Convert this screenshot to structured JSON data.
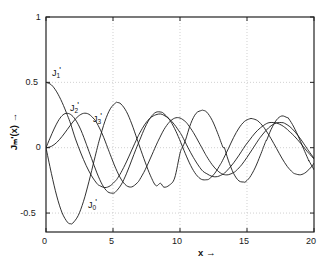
{
  "figure": {
    "background_color": "#ffffff",
    "curve_color": "#1a1a1a",
    "axis_color": "#222222",
    "grid_color": "#bbbbbb"
  },
  "axes": {
    "x_title": "x  →",
    "y_title": "Jₘ'(x)  →",
    "y_title_plain": "Jm'(x)",
    "x_ticks": [
      "0",
      "5",
      "10",
      "15",
      "20"
    ],
    "x_tick_values": [
      0,
      5,
      10,
      15,
      20
    ],
    "y_ticks": [
      "1",
      "0.5",
      "0",
      "-0.5"
    ],
    "y_tick_values": [
      1,
      0.5,
      0,
      -0.5
    ]
  },
  "curve_labels": [
    {
      "name": "J0-prime-label",
      "base": "J",
      "sub": "0",
      "prime": "'",
      "x_px": 88,
      "y_px": 198
    },
    {
      "name": "J1-prime-label",
      "base": "J",
      "sub": "1",
      "prime": "'",
      "x_px": 52,
      "y_px": 66
    },
    {
      "name": "J2-prime-label",
      "base": "J",
      "sub": "2",
      "prime": "'",
      "x_px": 70,
      "y_px": 101
    },
    {
      "name": "J3-prime-label",
      "base": "J",
      "sub": "3",
      "prime": "'",
      "x_px": 93,
      "y_px": 112
    }
  ],
  "chart_data": {
    "type": "line",
    "title": "",
    "subtitle": "",
    "xlabel": "x →",
    "ylabel": "J_m'(x) →",
    "xlim": [
      0,
      20
    ],
    "ylim": [
      -0.645,
      1.0
    ],
    "grid": true,
    "grid_style": "dotted",
    "legend": "inline-curve-labels",
    "legend_position": "inline",
    "x_tick_labels": [
      "0",
      "5",
      "10",
      "15",
      "20"
    ],
    "y_tick_labels": [
      "1",
      "0.5",
      "0",
      "-0.5"
    ],
    "annotations": [
      {
        "text": "J0'",
        "x": 1.3,
        "y": -0.38
      },
      {
        "text": "J1'",
        "x": 0.35,
        "y": 0.67
      },
      {
        "text": "J2'",
        "x": 1.6,
        "y": 0.36
      },
      {
        "text": "J3'",
        "x": 3.2,
        "y": 0.28
      }
    ],
    "series": [
      {
        "name": "J0'",
        "order": 0,
        "color": "#1a1a1a",
        "x": [
          0,
          0.4,
          0.8,
          1.2,
          1.6,
          1.84,
          2.0,
          2.4,
          2.8,
          3.2,
          3.6,
          3.83,
          4.0,
          4.4,
          4.8,
          5.2,
          5.33,
          5.6,
          6.0,
          6.4,
          6.8,
          7.0,
          7.4,
          7.8,
          8.2,
          8.54,
          8.8,
          9.2,
          9.6,
          10.0,
          10.17,
          10.4,
          10.8,
          11.2,
          11.6,
          11.71,
          12.0,
          12.4,
          12.8,
          13.2,
          13.32,
          13.6,
          14.0,
          14.4,
          14.8,
          14.86,
          15.2,
          15.6,
          16.0,
          16.4,
          16.47,
          16.8,
          17.2,
          17.6,
          18.0,
          18.07,
          18.4,
          18.8,
          19.2,
          19.6,
          19.61,
          20.0
        ],
        "y": [
          0,
          -0.196,
          -0.369,
          -0.498,
          -0.57,
          -0.582,
          -0.577,
          -0.52,
          -0.41,
          -0.261,
          -0.095,
          0,
          0.066,
          0.203,
          0.298,
          0.343,
          0.346,
          0.334,
          0.277,
          0.182,
          0.065,
          0.005,
          -0.11,
          -0.215,
          -0.29,
          -0.272,
          -0.302,
          -0.287,
          -0.232,
          -0.043,
          0,
          0.055,
          0.184,
          0.263,
          0.285,
          0.286,
          0.272,
          0.21,
          0.114,
          0.005,
          -0.001,
          -0.095,
          -0.197,
          -0.254,
          -0.263,
          -0.263,
          -0.228,
          -0.155,
          -0.057,
          0.049,
          0.058,
          0.14,
          0.212,
          0.243,
          0.23,
          0.228,
          0.176,
          0.094,
          -0.003,
          -0.097,
          -0.098,
          -0.168
        ]
      },
      {
        "name": "J1'",
        "order": 1,
        "color": "#1a1a1a",
        "x": [
          0,
          0.4,
          0.8,
          1.2,
          1.6,
          1.84,
          2.2,
          2.6,
          3.0,
          3.4,
          3.8,
          4.0,
          4.4,
          4.8,
          5.2,
          5.33,
          5.6,
          6.0,
          6.4,
          6.8,
          7.0,
          7.4,
          7.8,
          8.2,
          8.54,
          8.8,
          9.2,
          9.6,
          10.0,
          10.17,
          10.6,
          11.0,
          11.4,
          11.71,
          12.0,
          12.4,
          12.8,
          13.2,
          13.32,
          13.8,
          14.2,
          14.6,
          14.86,
          15.2,
          15.6,
          16.0,
          16.47,
          16.8,
          17.2,
          17.6,
          18.0,
          18.07,
          18.5,
          19.0,
          19.4,
          19.61,
          20.0
        ],
        "y": [
          0.5,
          0.481,
          0.427,
          0.347,
          0.248,
          0.182,
          0.067,
          -0.041,
          -0.137,
          -0.215,
          -0.274,
          -0.29,
          -0.305,
          -0.291,
          -0.252,
          -0.235,
          -0.19,
          -0.109,
          -0.018,
          0.072,
          0.113,
          0.182,
          0.229,
          0.252,
          0.258,
          0.248,
          0.22,
          0.175,
          0.116,
          0.087,
          0.0,
          -0.075,
          -0.14,
          -0.18,
          -0.199,
          -0.22,
          -0.221,
          -0.203,
          -0.195,
          -0.142,
          -0.088,
          -0.027,
          0.014,
          0.06,
          0.112,
          0.152,
          0.185,
          0.193,
          0.189,
          0.171,
          0.141,
          0.133,
          0.092,
          0.034,
          -0.017,
          -0.042,
          -0.086
        ]
      },
      {
        "name": "J2'",
        "order": 2,
        "color": "#1a1a1a",
        "x": [
          0,
          0.3,
          0.6,
          0.9,
          1.2,
          1.5,
          1.84,
          2.2,
          2.6,
          3.0,
          3.05,
          3.4,
          3.8,
          4.2,
          4.6,
          5.0,
          5.2,
          5.6,
          6.0,
          6.4,
          6.71,
          7.0,
          7.4,
          7.8,
          8.2,
          8.6,
          8.8,
          9.2,
          9.6,
          9.97,
          10.4,
          10.8,
          11.2,
          11.6,
          12.0,
          12.2,
          12.6,
          13.0,
          13.17,
          13.6,
          14.0,
          14.4,
          14.8,
          15.2,
          15.4,
          15.8,
          16.2,
          16.4,
          16.8,
          17.2,
          17.6,
          18.0,
          18.4,
          18.6,
          19.0,
          19.4,
          19.8,
          20.0
        ],
        "y": [
          0,
          0.073,
          0.143,
          0.203,
          0.245,
          0.263,
          0.254,
          0.214,
          0.136,
          0.03,
          0.015,
          -0.082,
          -0.193,
          -0.283,
          -0.337,
          -0.348,
          -0.337,
          -0.285,
          -0.2,
          -0.095,
          -0.012,
          0.06,
          0.157,
          0.231,
          0.271,
          0.272,
          0.26,
          0.217,
          0.146,
          0.062,
          -0.046,
          -0.137,
          -0.205,
          -0.242,
          -0.245,
          -0.237,
          -0.195,
          -0.13,
          -0.099,
          -0.009,
          0.078,
          0.15,
          0.2,
          0.221,
          0.222,
          0.206,
          0.163,
          0.134,
          0.068,
          -0.005,
          -0.079,
          -0.143,
          -0.188,
          -0.2,
          -0.207,
          -0.188,
          -0.147,
          -0.118
        ]
      },
      {
        "name": "J3'",
        "order": 3,
        "color": "#1a1a1a",
        "x": [
          0,
          0.4,
          0.8,
          1.2,
          1.6,
          2.0,
          2.4,
          2.8,
          3.2,
          3.6,
          3.8,
          4.2,
          4.6,
          4.8,
          5.2,
          5.6,
          6.0,
          6.4,
          6.8,
          7.0,
          7.4,
          7.8,
          8.2,
          8.4,
          8.8,
          9.2,
          9.6,
          10.0,
          10.4,
          10.6,
          11.0,
          11.4,
          11.8,
          12.0,
          12.4,
          12.8,
          13.2,
          13.6,
          14.0,
          14.2,
          14.6,
          15.0,
          15.4,
          15.8,
          16.0,
          16.4,
          16.8,
          17.2,
          17.6,
          17.8,
          18.2,
          18.6,
          19.0,
          19.4,
          19.6,
          20.0
        ],
        "y": [
          0,
          0.01,
          0.04,
          0.086,
          0.141,
          0.196,
          0.24,
          0.263,
          0.256,
          0.218,
          0.188,
          0.105,
          0.0,
          -0.054,
          -0.157,
          -0.24,
          -0.29,
          -0.3,
          -0.27,
          -0.243,
          -0.169,
          -0.079,
          0.014,
          0.058,
          0.138,
          0.195,
          0.226,
          0.227,
          0.2,
          0.176,
          0.116,
          0.043,
          -0.032,
          -0.068,
          -0.13,
          -0.176,
          -0.203,
          -0.207,
          -0.19,
          -0.175,
          -0.131,
          -0.074,
          -0.012,
          0.051,
          0.08,
          0.13,
          0.168,
          0.19,
          0.192,
          0.187,
          0.161,
          0.119,
          0.066,
          0.006,
          -0.024,
          -0.081
        ]
      }
    ]
  }
}
